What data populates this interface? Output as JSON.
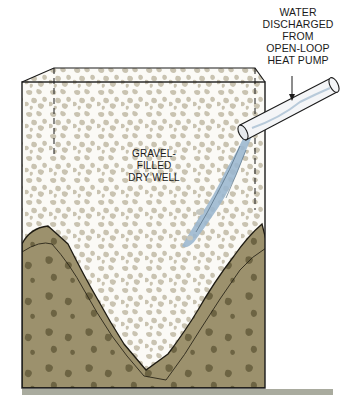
{
  "diagram": {
    "labels": {
      "callout_lines": [
        "WATER",
        "DISCHARGED",
        "FROM",
        "OPEN-LOOP",
        "HEAT PUMP"
      ],
      "well_lines": [
        "GRAVEL-",
        "FILLED",
        "DRY WELL"
      ]
    },
    "components": [
      {
        "name": "gravel-fill",
        "color": "#c8c2b0"
      },
      {
        "name": "soil",
        "color": "#9a8f6c"
      },
      {
        "name": "soil-stones",
        "color": "#6f6645"
      },
      {
        "name": "water-stream",
        "color": "#9ab6cf"
      },
      {
        "name": "discharge-pipe",
        "color": "#f2f4f6"
      },
      {
        "name": "ground-line",
        "color": "#a9ab9e"
      }
    ]
  }
}
